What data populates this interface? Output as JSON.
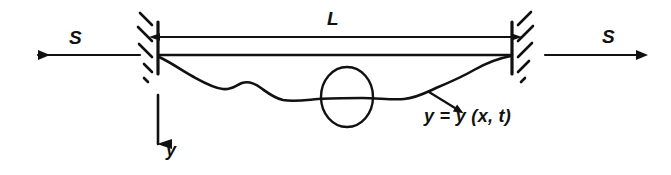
{
  "figure": {
    "name": "vibrating-string-diagram",
    "background_color": "#ffffff",
    "ink_color": "#111111",
    "width": 671,
    "height": 175
  },
  "labels": {
    "length": "L",
    "tension_left": "S",
    "tension_right": "S",
    "y_axis": "y",
    "displacement_equation": "y = y (x, t)"
  },
  "elements": {
    "left_support": {
      "name": "left-wall-support",
      "x": 158,
      "y_top": 22,
      "y_bottom": 74,
      "hatch_count": 4,
      "hatch_direction": "up-right"
    },
    "right_support": {
      "name": "right-wall-support",
      "x": 512,
      "y_top": 22,
      "y_bottom": 74,
      "hatch_count": 4,
      "hatch_direction": "up-right"
    },
    "dimension_line": {
      "name": "length-dimension-arrow",
      "x_start": 160,
      "x_end": 511,
      "y": 37,
      "arrowheads": "both"
    },
    "equilibrium_line": {
      "name": "string-equilibrium-line",
      "x_start": 158,
      "x_end": 512,
      "y": 55
    },
    "tension_arrow_left": {
      "name": "tension-arrow-left",
      "x_start": 140,
      "x_end": 38,
      "y": 55,
      "direction": "left"
    },
    "tension_arrow_right": {
      "name": "tension-arrow-right",
      "x_start": 545,
      "x_end": 636,
      "y": 55,
      "direction": "right"
    },
    "y_axis_arrow": {
      "name": "y-axis-arrow",
      "x": 158,
      "y_start": 95,
      "y_end": 144,
      "direction": "down"
    },
    "displaced_string": {
      "name": "displaced-string-curve",
      "path": "M 159,57 C 172,63 181,70 192,76 C 203,82 213,88 223,89 C 232,90 236,85 242,83 C 248,81 254,83 261,88 C 268,93 274,98 283,100 C 294,102 306,100 318,99 C 332,98 348,98 362,98 C 378,98 392,100 404,99 C 416,98 425,93 436,88 C 448,83 462,77 474,70 C 488,62 500,58 511,56"
    },
    "marker_ellipse": {
      "name": "string-segment-marker-ellipse",
      "cx": 347,
      "cy": 97,
      "rx": 26,
      "ry": 30
    },
    "leader_arrow": {
      "name": "equation-leader-arrow",
      "x_start": 429,
      "y_start": 92,
      "x_end": 457,
      "y_end": 110
    }
  }
}
